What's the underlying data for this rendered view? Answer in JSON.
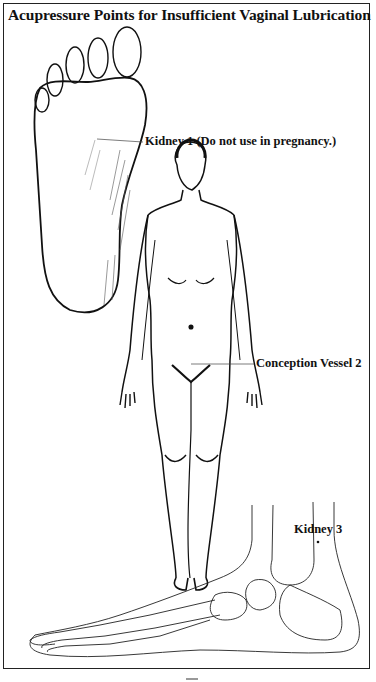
{
  "page": {
    "title": "Acupressure Points for Insufficient Vaginal Lubrication"
  },
  "figures": [
    {
      "id": "foot-sole",
      "description": "Sole of the foot (plantar view)"
    },
    {
      "id": "female-body",
      "description": "Front view of female figure"
    },
    {
      "id": "foot-skeleton",
      "description": "Medial view of foot bones and ankle"
    }
  ],
  "points": [
    {
      "name": "Kidney 1",
      "label": "Kidney 1 (Do not use in pregnancy.)"
    },
    {
      "name": "Conception Vessel 2",
      "label": "Conception Vessel 2"
    },
    {
      "name": "Kidney 3",
      "label": "Kidney 3"
    }
  ],
  "colors": {
    "ink": "#111111",
    "paper": "#ffffff",
    "border": "#222222"
  }
}
